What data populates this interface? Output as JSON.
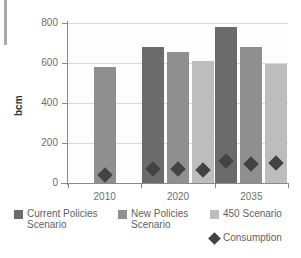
{
  "chart_data": {
    "type": "bar",
    "title": "",
    "xlabel": "",
    "ylabel": "bcm",
    "ylim": [
      0,
      800
    ],
    "yticks": [
      0,
      200,
      400,
      600,
      800
    ],
    "ytick_labels": [
      "0",
      "200",
      "400",
      "600",
      "800"
    ],
    "categories": [
      "2010",
      "2020",
      "2035"
    ],
    "grid": true,
    "legend_position": "bottom",
    "series": [
      {
        "name": "Current Policies Scenario",
        "key": "cps",
        "color": "#6b6b6b",
        "type": "bar",
        "values": [
          null,
          680,
          780
        ]
      },
      {
        "name": "New Policies Scenario",
        "key": "nps",
        "color": "#8f8f8f",
        "type": "bar",
        "values": [
          580,
          655,
          680
        ]
      },
      {
        "name": "450 Scenario",
        "key": "s450",
        "color": "#bdbdbd",
        "type": "bar",
        "values": [
          null,
          610,
          595
        ]
      },
      {
        "name": "Consumption",
        "key": "consumption",
        "color": "#434343",
        "type": "scatter",
        "marker": "diamond",
        "values": [
          [
            70
          ],
          [
            100,
            98,
            92
          ],
          [
            137,
            125,
            130
          ]
        ]
      }
    ]
  },
  "legend": {
    "entries": [
      {
        "label": "Current Policies\nScenario",
        "swatch": "cps",
        "icon": "square-swatch"
      },
      {
        "label": "New Policies\nScenario",
        "swatch": "nps",
        "icon": "square-swatch"
      },
      {
        "label": "450 Scenario",
        "swatch": "s450",
        "icon": "square-swatch"
      },
      {
        "label": "Consumption",
        "swatch": "consumption",
        "icon": "diamond-marker"
      }
    ]
  },
  "colors": {
    "current_policies": "#6b6b6b",
    "new_policies": "#8f8f8f",
    "scenario_450": "#bdbdbd",
    "consumption": "#434343",
    "gridline": "#d8d8d8",
    "axis": "#8a8a8a",
    "edge_strip": "#a8a8a8"
  }
}
